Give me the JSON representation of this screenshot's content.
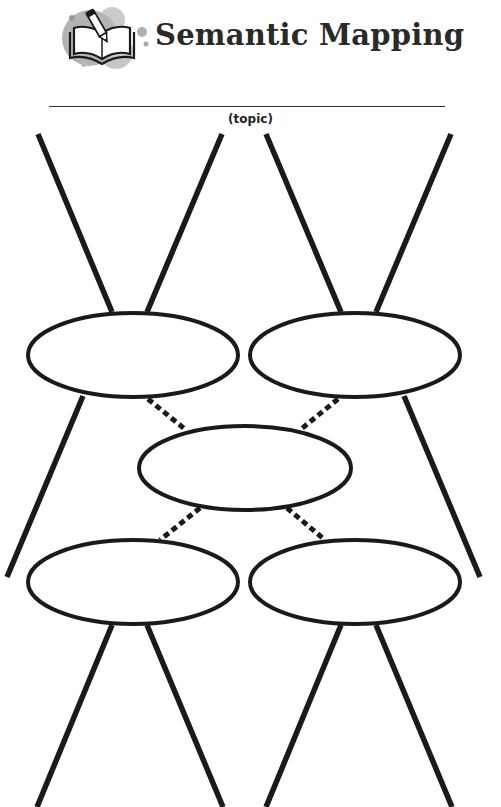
{
  "header": {
    "title": "Semantic Mapping",
    "icon": "book-pencil-icon"
  },
  "topic": {
    "label": "(topic)",
    "value": ""
  },
  "diagram": {
    "nodes": [
      {
        "id": "top-left",
        "cx": 133,
        "cy": 355,
        "rx": 105,
        "ry": 42,
        "text": ""
      },
      {
        "id": "top-right",
        "cx": 355,
        "cy": 355,
        "rx": 105,
        "ry": 42,
        "text": ""
      },
      {
        "id": "center",
        "cx": 245,
        "cy": 468,
        "rx": 106,
        "ry": 42,
        "text": ""
      },
      {
        "id": "bottom-left",
        "cx": 133,
        "cy": 582,
        "rx": 105,
        "ry": 42,
        "text": ""
      },
      {
        "id": "bottom-right",
        "cx": 355,
        "cy": 582,
        "rx": 105,
        "ry": 42,
        "text": ""
      }
    ],
    "solid_lines": [
      {
        "x1": 38,
        "y1": 134,
        "x2": 112,
        "y2": 312
      },
      {
        "x1": 222,
        "y1": 134,
        "x2": 147,
        "y2": 312
      },
      {
        "x1": 266,
        "y1": 134,
        "x2": 341,
        "y2": 312
      },
      {
        "x1": 451,
        "y1": 134,
        "x2": 376,
        "y2": 312
      },
      {
        "x1": 83,
        "y1": 396,
        "x2": 7,
        "y2": 577
      },
      {
        "x1": 404,
        "y1": 396,
        "x2": 480,
        "y2": 577
      },
      {
        "x1": 112,
        "y1": 625,
        "x2": 37,
        "y2": 807
      },
      {
        "x1": 147,
        "y1": 625,
        "x2": 223,
        "y2": 807
      },
      {
        "x1": 341,
        "y1": 625,
        "x2": 266,
        "y2": 807
      },
      {
        "x1": 376,
        "y1": 625,
        "x2": 452,
        "y2": 807
      }
    ],
    "dashed_lines": [
      {
        "x1": 148,
        "y1": 399,
        "x2": 186,
        "y2": 430
      },
      {
        "x1": 338,
        "y1": 399,
        "x2": 300,
        "y2": 430
      },
      {
        "x1": 200,
        "y1": 508,
        "x2": 160,
        "y2": 540
      },
      {
        "x1": 287,
        "y1": 508,
        "x2": 325,
        "y2": 540
      }
    ]
  }
}
